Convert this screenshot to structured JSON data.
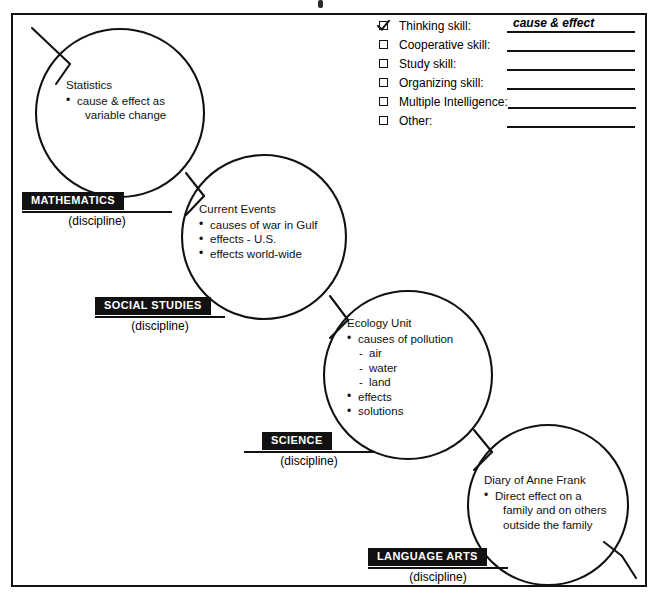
{
  "document": {
    "type": "graphic-organizer-worksheet",
    "frame_border_color": "#111111"
  },
  "checklist": {
    "rows": [
      {
        "label": "Thinking skill:",
        "checked": true,
        "value": "cause & effect"
      },
      {
        "label": "Cooperative skill:",
        "checked": false,
        "value": ""
      },
      {
        "label": "Study skill:",
        "checked": false,
        "value": ""
      },
      {
        "label": "Organizing skill:",
        "checked": false,
        "value": ""
      },
      {
        "label": "Multiple Intelligence:",
        "checked": false,
        "value": ""
      },
      {
        "label": "Other:",
        "checked": false,
        "value": ""
      }
    ]
  },
  "nodes": [
    {
      "id": "statistics",
      "title": "Statistics",
      "items": [
        {
          "kind": "bullet",
          "text": "cause & effect as"
        },
        {
          "kind": "cont",
          "text": "variable change"
        }
      ]
    },
    {
      "id": "current-events",
      "title": "Current Events",
      "items": [
        {
          "kind": "bullet",
          "text": "causes of war in Gulf"
        },
        {
          "kind": "bullet",
          "text": "effects - U.S."
        },
        {
          "kind": "bullet",
          "text": "effects world-wide"
        }
      ]
    },
    {
      "id": "ecology-unit",
      "title": "Ecology Unit",
      "items": [
        {
          "kind": "bullet",
          "text": "causes of pollution"
        },
        {
          "kind": "dash",
          "text": "air"
        },
        {
          "kind": "dash",
          "text": "water"
        },
        {
          "kind": "dash",
          "text": "land"
        },
        {
          "kind": "bullet",
          "text": "effects"
        },
        {
          "kind": "bullet",
          "text": "solutions"
        }
      ]
    },
    {
      "id": "diary-of-anne-frank",
      "title": "Diary of Anne Frank",
      "items": [
        {
          "kind": "bullet",
          "text": "Direct effect on a"
        },
        {
          "kind": "cont",
          "text": "family and on others"
        },
        {
          "kind": "cont",
          "text": "outside the family"
        }
      ]
    }
  ],
  "disciplines": [
    {
      "id": "mathematics",
      "tag": "MATHEMATICS",
      "caption": "(discipline)"
    },
    {
      "id": "social-studies",
      "tag": "SOCIAL STUDIES",
      "caption": "(discipline)"
    },
    {
      "id": "science",
      "tag": "SCIENCE",
      "caption": "(discipline)"
    },
    {
      "id": "language-arts",
      "tag": "LANGUAGE ARTS",
      "caption": "(discipline)"
    }
  ]
}
